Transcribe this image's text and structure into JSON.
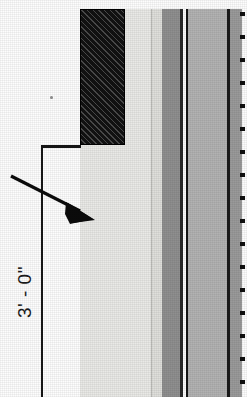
{
  "drawing": {
    "kind": "architectural-wall-section-detail",
    "sheet_background": "#fdfdfd",
    "dimension": {
      "label": "3' - 0\"",
      "orientation": "vertical-rotated-90",
      "extension_line_color": "#151515",
      "tick_label": ""
    },
    "leader": {
      "name": "leader-arrow",
      "points_to": "light-finish-band",
      "color": "#0b0b0b"
    },
    "materials": [
      {
        "id": "hatched-block",
        "label": "",
        "fill": "#121212",
        "pattern": "diagonal-hatch-45"
      },
      {
        "id": "finish-band-1",
        "label": "",
        "fill": "#e9e9e6",
        "pattern": "solid"
      },
      {
        "id": "finish-band-2",
        "label": "",
        "fill": "#dededa",
        "pattern": "solid"
      },
      {
        "id": "core-band-dark",
        "label": "",
        "fill": "#8f8f8f",
        "pattern": "solid"
      },
      {
        "id": "air-gap",
        "label": "",
        "fill": "#fbfbfb",
        "pattern": "solid"
      },
      {
        "id": "substrate-band",
        "label": "",
        "fill": "#aeaeae",
        "pattern": "solid"
      },
      {
        "id": "outer-band",
        "label": "",
        "fill": "#9a9a9a",
        "pattern": "solid"
      }
    ],
    "edge_ticks": {
      "name": "edge-tick-marks",
      "count": 17,
      "color": "#101010"
    }
  }
}
